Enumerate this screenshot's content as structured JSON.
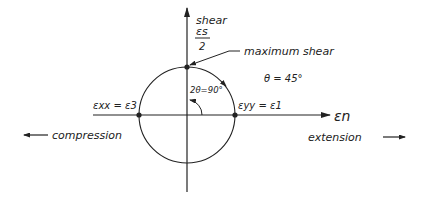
{
  "axes": {
    "vertical_label": "shear",
    "vertical_symbol": "εs",
    "vertical_denominator": "2",
    "horizontal_symbol": "εn"
  },
  "annotations": {
    "max_shear": "maximum shear",
    "theta": "θ = 45°",
    "two_theta": "2θ=90°",
    "left_point": "εxx = ε3",
    "right_point": "εyy = ε1",
    "compression": "compression",
    "extension": "extension"
  },
  "colors": {
    "ink": "#222222",
    "background": "#ffffff"
  }
}
